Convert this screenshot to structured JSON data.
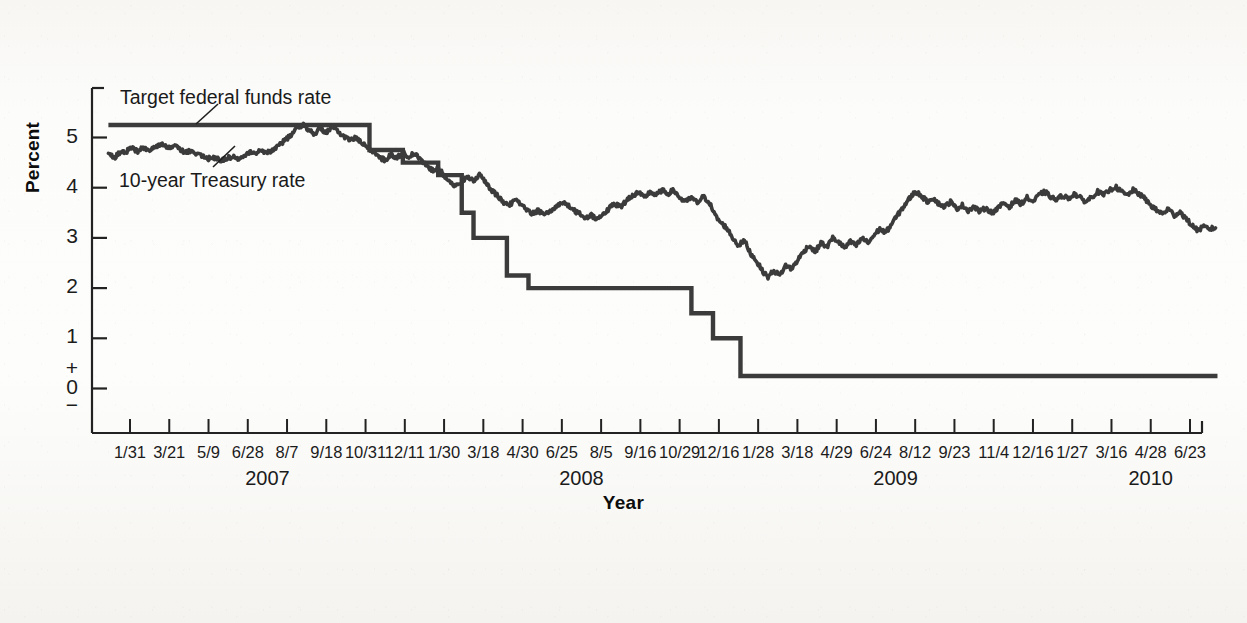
{
  "figure": {
    "axis_title_y": "Percent",
    "axis_title_x": "Year",
    "series_labels": {
      "target": "Target federal funds rate",
      "treasury": "10-year Treasury rate"
    },
    "y_ticks": [
      "5",
      "4",
      "3",
      "2",
      "1",
      "+",
      "0",
      "−"
    ],
    "colors": {
      "line": "#3b3b3b",
      "axis": "#222222",
      "text": "#1b1b1b",
      "background": "#fbfaf8"
    }
  },
  "chart_data": {
    "type": "line",
    "title": "",
    "subtitle": "",
    "xlabel": "Year",
    "ylabel": "Percent",
    "ylim": [
      -0.35,
      6.0
    ],
    "grid": false,
    "legend": "inline-annotations",
    "y_tick_values": [
      0,
      1,
      2,
      3,
      4,
      5
    ],
    "x_tick_labels": [
      "1/31",
      "3/21",
      "5/9",
      "6/28",
      "8/7",
      "9/18",
      "10/31",
      "12/11",
      "1/30",
      "3/18",
      "4/30",
      "6/25",
      "8/5",
      "9/16",
      "10/29",
      "12/16",
      "1/28",
      "3/18",
      "4/29",
      "6/24",
      "8/12",
      "9/23",
      "11/4",
      "12/16",
      "1/27",
      "3/16",
      "4/28",
      "6/23"
    ],
    "x_group_labels": [
      "2007",
      "2008",
      "2009",
      "2010"
    ],
    "x_group_tick_centers": [
      3.5,
      11.5,
      19.5,
      26.0
    ],
    "annotations": [
      {
        "text": "Target federal funds rate",
        "x_tick": 0.6,
        "y": 5.95
      },
      {
        "text": "10-year Treasury rate",
        "x_tick": 0.6,
        "y": 4.35
      }
    ],
    "series": [
      {
        "name": "Target federal funds rate",
        "style": "step",
        "units": "percent",
        "points": [
          {
            "t": -0.55,
            "v": 5.25
          },
          {
            "t": 6.1,
            "v": 5.25
          },
          {
            "t": 6.1,
            "v": 4.75
          },
          {
            "t": 6.95,
            "v": 4.75
          },
          {
            "t": 6.95,
            "v": 4.5
          },
          {
            "t": 7.85,
            "v": 4.5
          },
          {
            "t": 7.85,
            "v": 4.25
          },
          {
            "t": 8.45,
            "v": 4.25
          },
          {
            "t": 8.45,
            "v": 3.5
          },
          {
            "t": 8.75,
            "v": 3.5
          },
          {
            "t": 8.75,
            "v": 3.0
          },
          {
            "t": 9.6,
            "v": 3.0
          },
          {
            "t": 9.6,
            "v": 2.25
          },
          {
            "t": 10.15,
            "v": 2.25
          },
          {
            "t": 10.15,
            "v": 2.0
          },
          {
            "t": 14.3,
            "v": 2.0
          },
          {
            "t": 14.3,
            "v": 1.5
          },
          {
            "t": 14.85,
            "v": 1.5
          },
          {
            "t": 14.85,
            "v": 1.0
          },
          {
            "t": 15.55,
            "v": 1.0
          },
          {
            "t": 15.55,
            "v": 0.25
          },
          {
            "t": 27.7,
            "v": 0.25
          }
        ]
      },
      {
        "name": "10-year Treasury rate",
        "style": "line",
        "units": "percent",
        "points": [
          {
            "t": -0.55,
            "v": 4.67
          },
          {
            "t": -0.4,
            "v": 4.6
          },
          {
            "t": -0.25,
            "v": 4.7
          },
          {
            "t": -0.1,
            "v": 4.72
          },
          {
            "t": 0.05,
            "v": 4.78
          },
          {
            "t": 0.2,
            "v": 4.73
          },
          {
            "t": 0.35,
            "v": 4.8
          },
          {
            "t": 0.5,
            "v": 4.76
          },
          {
            "t": 0.65,
            "v": 4.82
          },
          {
            "t": 0.8,
            "v": 4.88
          },
          {
            "t": 0.95,
            "v": 4.8
          },
          {
            "t": 1.1,
            "v": 4.84
          },
          {
            "t": 1.25,
            "v": 4.78
          },
          {
            "t": 1.4,
            "v": 4.7
          },
          {
            "t": 1.55,
            "v": 4.74
          },
          {
            "t": 1.7,
            "v": 4.68
          },
          {
            "t": 1.85,
            "v": 4.63
          },
          {
            "t": 2.0,
            "v": 4.58
          },
          {
            "t": 2.15,
            "v": 4.6
          },
          {
            "t": 2.3,
            "v": 4.55
          },
          {
            "t": 2.45,
            "v": 4.58
          },
          {
            "t": 2.6,
            "v": 4.62
          },
          {
            "t": 2.75,
            "v": 4.58
          },
          {
            "t": 2.9,
            "v": 4.65
          },
          {
            "t": 3.05,
            "v": 4.72
          },
          {
            "t": 3.2,
            "v": 4.68
          },
          {
            "t": 3.35,
            "v": 4.75
          },
          {
            "t": 3.5,
            "v": 4.7
          },
          {
            "t": 3.65,
            "v": 4.76
          },
          {
            "t": 3.8,
            "v": 4.85
          },
          {
            "t": 3.95,
            "v": 4.95
          },
          {
            "t": 4.1,
            "v": 5.05
          },
          {
            "t": 4.25,
            "v": 5.18
          },
          {
            "t": 4.4,
            "v": 5.26
          },
          {
            "t": 4.55,
            "v": 5.15
          },
          {
            "t": 4.7,
            "v": 5.08
          },
          {
            "t": 4.85,
            "v": 5.18
          },
          {
            "t": 5.0,
            "v": 5.1
          },
          {
            "t": 5.15,
            "v": 5.2
          },
          {
            "t": 5.3,
            "v": 5.12
          },
          {
            "t": 5.45,
            "v": 5.02
          },
          {
            "t": 5.6,
            "v": 4.95
          },
          {
            "t": 5.75,
            "v": 5.0
          },
          {
            "t": 5.9,
            "v": 4.88
          },
          {
            "t": 6.05,
            "v": 4.8
          },
          {
            "t": 6.2,
            "v": 4.72
          },
          {
            "t": 6.35,
            "v": 4.6
          },
          {
            "t": 6.5,
            "v": 4.55
          },
          {
            "t": 6.65,
            "v": 4.66
          },
          {
            "t": 6.8,
            "v": 4.6
          },
          {
            "t": 6.95,
            "v": 4.7
          },
          {
            "t": 7.1,
            "v": 4.62
          },
          {
            "t": 7.25,
            "v": 4.68
          },
          {
            "t": 7.4,
            "v": 4.55
          },
          {
            "t": 7.55,
            "v": 4.45
          },
          {
            "t": 7.7,
            "v": 4.35
          },
          {
            "t": 7.85,
            "v": 4.4
          },
          {
            "t": 8.0,
            "v": 4.25
          },
          {
            "t": 8.15,
            "v": 4.12
          },
          {
            "t": 8.3,
            "v": 4.02
          },
          {
            "t": 8.45,
            "v": 4.1
          },
          {
            "t": 8.6,
            "v": 4.22
          },
          {
            "t": 8.75,
            "v": 4.15
          },
          {
            "t": 8.9,
            "v": 4.25
          },
          {
            "t": 9.05,
            "v": 4.12
          },
          {
            "t": 9.2,
            "v": 3.95
          },
          {
            "t": 9.35,
            "v": 3.85
          },
          {
            "t": 9.5,
            "v": 3.72
          },
          {
            "t": 9.65,
            "v": 3.65
          },
          {
            "t": 9.8,
            "v": 3.75
          },
          {
            "t": 9.95,
            "v": 3.68
          },
          {
            "t": 10.1,
            "v": 3.55
          },
          {
            "t": 10.25,
            "v": 3.48
          },
          {
            "t": 10.4,
            "v": 3.55
          },
          {
            "t": 10.55,
            "v": 3.45
          },
          {
            "t": 10.7,
            "v": 3.52
          },
          {
            "t": 10.85,
            "v": 3.62
          },
          {
            "t": 11.0,
            "v": 3.72
          },
          {
            "t": 11.15,
            "v": 3.65
          },
          {
            "t": 11.3,
            "v": 3.55
          },
          {
            "t": 11.45,
            "v": 3.48
          },
          {
            "t": 11.6,
            "v": 3.4
          },
          {
            "t": 11.75,
            "v": 3.45
          },
          {
            "t": 11.9,
            "v": 3.38
          },
          {
            "t": 12.05,
            "v": 3.48
          },
          {
            "t": 12.2,
            "v": 3.58
          },
          {
            "t": 12.35,
            "v": 3.68
          },
          {
            "t": 12.5,
            "v": 3.62
          },
          {
            "t": 12.65,
            "v": 3.75
          },
          {
            "t": 12.8,
            "v": 3.85
          },
          {
            "t": 12.95,
            "v": 3.9
          },
          {
            "t": 13.1,
            "v": 3.8
          },
          {
            "t": 13.25,
            "v": 3.92
          },
          {
            "t": 13.4,
            "v": 3.85
          },
          {
            "t": 13.55,
            "v": 3.95
          },
          {
            "t": 13.7,
            "v": 3.88
          },
          {
            "t": 13.85,
            "v": 3.95
          },
          {
            "t": 14.0,
            "v": 3.8
          },
          {
            "t": 14.15,
            "v": 3.72
          },
          {
            "t": 14.3,
            "v": 3.8
          },
          {
            "t": 14.45,
            "v": 3.7
          },
          {
            "t": 14.6,
            "v": 3.82
          },
          {
            "t": 14.75,
            "v": 3.72
          },
          {
            "t": 14.9,
            "v": 3.45
          },
          {
            "t": 15.05,
            "v": 3.3
          },
          {
            "t": 15.2,
            "v": 3.2
          },
          {
            "t": 15.35,
            "v": 3.0
          },
          {
            "t": 15.5,
            "v": 2.85
          },
          {
            "t": 15.65,
            "v": 2.95
          },
          {
            "t": 15.8,
            "v": 2.7
          },
          {
            "t": 15.95,
            "v": 2.55
          },
          {
            "t": 16.1,
            "v": 2.35
          },
          {
            "t": 16.25,
            "v": 2.22
          },
          {
            "t": 16.4,
            "v": 2.35
          },
          {
            "t": 16.55,
            "v": 2.25
          },
          {
            "t": 16.7,
            "v": 2.45
          },
          {
            "t": 16.85,
            "v": 2.38
          },
          {
            "t": 17.0,
            "v": 2.55
          },
          {
            "t": 17.15,
            "v": 2.72
          },
          {
            "t": 17.3,
            "v": 2.85
          },
          {
            "t": 17.45,
            "v": 2.72
          },
          {
            "t": 17.6,
            "v": 2.9
          },
          {
            "t": 17.75,
            "v": 2.82
          },
          {
            "t": 17.9,
            "v": 3.0
          },
          {
            "t": 18.05,
            "v": 2.92
          },
          {
            "t": 18.2,
            "v": 2.8
          },
          {
            "t": 18.35,
            "v": 2.92
          },
          {
            "t": 18.5,
            "v": 2.85
          },
          {
            "t": 18.65,
            "v": 3.0
          },
          {
            "t": 18.8,
            "v": 2.9
          },
          {
            "t": 18.95,
            "v": 3.05
          },
          {
            "t": 19.1,
            "v": 3.18
          },
          {
            "t": 19.25,
            "v": 3.1
          },
          {
            "t": 19.4,
            "v": 3.28
          },
          {
            "t": 19.55,
            "v": 3.45
          },
          {
            "t": 19.7,
            "v": 3.62
          },
          {
            "t": 19.85,
            "v": 3.78
          },
          {
            "t": 20.0,
            "v": 3.92
          },
          {
            "t": 20.15,
            "v": 3.85
          },
          {
            "t": 20.3,
            "v": 3.72
          },
          {
            "t": 20.45,
            "v": 3.8
          },
          {
            "t": 20.6,
            "v": 3.68
          },
          {
            "t": 20.75,
            "v": 3.62
          },
          {
            "t": 20.9,
            "v": 3.72
          },
          {
            "t": 21.05,
            "v": 3.58
          },
          {
            "t": 21.2,
            "v": 3.65
          },
          {
            "t": 21.35,
            "v": 3.55
          },
          {
            "t": 21.5,
            "v": 3.62
          },
          {
            "t": 21.65,
            "v": 3.52
          },
          {
            "t": 21.8,
            "v": 3.6
          },
          {
            "t": 21.95,
            "v": 3.5
          },
          {
            "t": 22.1,
            "v": 3.58
          },
          {
            "t": 22.25,
            "v": 3.7
          },
          {
            "t": 22.4,
            "v": 3.62
          },
          {
            "t": 22.55,
            "v": 3.75
          },
          {
            "t": 22.7,
            "v": 3.68
          },
          {
            "t": 22.85,
            "v": 3.8
          },
          {
            "t": 23.0,
            "v": 3.72
          },
          {
            "t": 23.15,
            "v": 3.85
          },
          {
            "t": 23.3,
            "v": 3.92
          },
          {
            "t": 23.45,
            "v": 3.82
          },
          {
            "t": 23.6,
            "v": 3.75
          },
          {
            "t": 23.75,
            "v": 3.85
          },
          {
            "t": 23.9,
            "v": 3.78
          },
          {
            "t": 24.05,
            "v": 3.88
          },
          {
            "t": 24.2,
            "v": 3.8
          },
          {
            "t": 24.35,
            "v": 3.72
          },
          {
            "t": 24.5,
            "v": 3.82
          },
          {
            "t": 24.65,
            "v": 3.92
          },
          {
            "t": 24.8,
            "v": 3.85
          },
          {
            "t": 24.95,
            "v": 3.95
          },
          {
            "t": 25.1,
            "v": 4.02
          },
          {
            "t": 25.25,
            "v": 3.92
          },
          {
            "t": 25.4,
            "v": 3.85
          },
          {
            "t": 25.55,
            "v": 3.95
          },
          {
            "t": 25.7,
            "v": 3.88
          },
          {
            "t": 25.85,
            "v": 3.78
          },
          {
            "t": 26.0,
            "v": 3.65
          },
          {
            "t": 26.15,
            "v": 3.55
          },
          {
            "t": 26.3,
            "v": 3.48
          },
          {
            "t": 26.45,
            "v": 3.58
          },
          {
            "t": 26.6,
            "v": 3.45
          },
          {
            "t": 26.75,
            "v": 3.52
          },
          {
            "t": 26.9,
            "v": 3.38
          },
          {
            "t": 27.05,
            "v": 3.25
          },
          {
            "t": 27.2,
            "v": 3.15
          },
          {
            "t": 27.35,
            "v": 3.22
          },
          {
            "t": 27.5,
            "v": 3.18
          },
          {
            "t": 27.65,
            "v": 3.2
          }
        ]
      }
    ]
  }
}
